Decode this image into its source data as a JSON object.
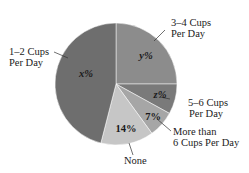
{
  "chart_data": {
    "type": "pie",
    "title": "",
    "start_angle_deg": 0,
    "direction": "clockwise",
    "slices": [
      {
        "label": "3–4 Cups Per Day",
        "value_label": "y%",
        "value": 25,
        "color": "#8c8c8c"
      },
      {
        "label": "5–6 Cups Per Day",
        "value_label": "z%",
        "value": 8,
        "color": "#7a7a7a"
      },
      {
        "label": "More than 6 Cups Per Day",
        "value_label": "7%",
        "value": 7,
        "color": "#a6a6a6"
      },
      {
        "label": "None",
        "value_label": "14%",
        "value": 14,
        "color": "#c6c6c6"
      },
      {
        "label": "1–2 Cups Per Day",
        "value_label": "x%",
        "value": 46,
        "color": "#6e6e6e"
      }
    ],
    "legend": "none",
    "annotations": "leader-line callout labels"
  },
  "labels": {
    "cups_3_4": [
      "3–4 Cups",
      "Per Day"
    ],
    "cups_1_2": [
      "1–2 Cups",
      "Per Day"
    ],
    "cups_5_6": [
      "5–6 Cups",
      "Per Day"
    ],
    "more_than_6": [
      "More than",
      "6 Cups Per Day"
    ],
    "none": "None"
  },
  "pct_labels": {
    "y": "y%",
    "x": "x%",
    "z": "z%",
    "seven": "7%",
    "fourteen": "14%"
  }
}
